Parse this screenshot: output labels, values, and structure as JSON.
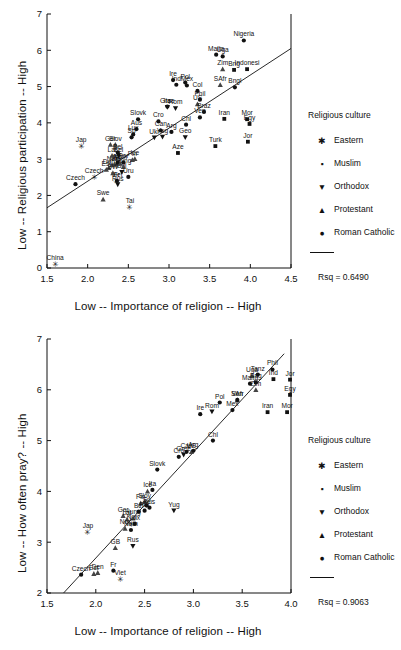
{
  "legend": {
    "title": "Religious culture",
    "entries": [
      {
        "label": "Eastern",
        "marker": "star-marker"
      },
      {
        "label": "Muslim",
        "marker": "square-marker"
      },
      {
        "label": "Orthodox",
        "marker": "triangle-down-marker"
      },
      {
        "label": "Protestant",
        "marker": "triangle-up-marker"
      },
      {
        "label": "Roman Catholic",
        "marker": "circle-marker"
      }
    ]
  },
  "charts": [
    {
      "id": "religious-participation",
      "chart_data": {
        "type": "scatter",
        "title": "",
        "xlabel": "Low -- Importance of religion -- High",
        "ylabel": "Low -- Religious participation -- High",
        "xlim": [
          1.5,
          4.5
        ],
        "ylim": [
          0,
          7
        ],
        "xticks": [
          "1.5",
          "2.0",
          "2.5",
          "3.0",
          "3.5",
          "4.0",
          "4.5"
        ],
        "yticks": [
          "0",
          "1",
          "2",
          "3",
          "4",
          "5",
          "6",
          "7"
        ],
        "grid": false,
        "legend_position": "right",
        "rsq_label": "Rsq = 0.6490",
        "rsq": 0.649,
        "fit_line": {
          "x": [
            1.5,
            4.5
          ],
          "y": [
            1.66,
            6.05
          ]
        },
        "series": [
          {
            "name": "Eastern",
            "marker": "star-marker",
            "points": [
              {
                "label": "China",
                "x": 1.6,
                "y": 0.1
              },
              {
                "label": "Jap",
                "x": 1.92,
                "y": 3.36
              },
              {
                "label": "Czech",
                "x": 2.08,
                "y": 2.52
              },
              {
                "label": "Tai",
                "x": 2.52,
                "y": 1.68
              },
              {
                "label": "Viet",
                "x": 2.36,
                "y": 2.4
              },
              {
                "label": "Kor",
                "x": 2.36,
                "y": 2.84
              }
            ]
          },
          {
            "name": "Muslim",
            "marker": "square-marker",
            "points": [
              {
                "label": "Turk",
                "x": 3.57,
                "y": 3.36
              },
              {
                "label": "Iran",
                "x": 3.68,
                "y": 4.11
              },
              {
                "label": "Mor",
                "x": 3.96,
                "y": 4.1
              },
              {
                "label": "Egy",
                "x": 3.99,
                "y": 3.97
              },
              {
                "label": "Jor",
                "x": 3.97,
                "y": 3.48
              },
              {
                "label": "Indonesi",
                "x": 3.96,
                "y": 5.48
              },
              {
                "label": "Bng",
                "x": 3.8,
                "y": 5.46
              },
              {
                "label": "Aze",
                "x": 3.11,
                "y": 3.17
              },
              {
                "label": "Alb",
                "x": 2.37,
                "y": 2.9
              }
            ]
          },
          {
            "name": "Orthodox",
            "marker": "triangle-down-marker",
            "points": [
              {
                "label": "Rus",
                "x": 2.37,
                "y": 2.3
              },
              {
                "label": "Gree",
                "x": 2.98,
                "y": 4.43
              },
              {
                "label": "Rom",
                "x": 3.08,
                "y": 4.4
              },
              {
                "label": "Bel",
                "x": 2.38,
                "y": 3.1
              },
              {
                "label": "Ukr",
                "x": 2.82,
                "y": 3.59
              },
              {
                "label": "Bul",
                "x": 2.42,
                "y": 2.64
              },
              {
                "label": "Yug",
                "x": 2.92,
                "y": 3.61
              },
              {
                "label": "Geo",
                "x": 3.2,
                "y": 3.6
              }
            ]
          },
          {
            "name": "Protestant",
            "marker": "triangle-up-marker",
            "points": [
              {
                "label": "SAfr",
                "x": 3.63,
                "y": 5.05
              },
              {
                "label": "Zim",
                "x": 3.66,
                "y": 5.48
              },
              {
                "label": "Est",
                "x": 2.23,
                "y": 2.71
              },
              {
                "label": "Den",
                "x": 2.26,
                "y": 2.76
              },
              {
                "label": "Swe",
                "x": 2.19,
                "y": 1.89
              },
              {
                "label": "Nor",
                "x": 2.3,
                "y": 2.84
              },
              {
                "label": "Fin",
                "x": 2.55,
                "y": 2.98
              },
              {
                "label": "GB",
                "x": 2.33,
                "y": 2.86
              },
              {
                "label": "Ger",
                "x": 2.28,
                "y": 3.4
              },
              {
                "label": "Lat",
                "x": 2.3,
                "y": 3.1
              },
              {
                "label": "Slov",
                "x": 2.34,
                "y": 3.4
              },
              {
                "label": "Ice",
                "x": 2.58,
                "y": 3.01
              },
              {
                "label": "Neth",
                "x": 2.4,
                "y": 2.88
              },
              {
                "label": "Hung",
                "x": 2.44,
                "y": 2.79
              },
              {
                "label": "US",
                "x": 3.35,
                "y": 4.52
              },
              {
                "label": "SW",
                "x": 2.31,
                "y": 2.62
              }
            ]
          },
          {
            "name": "Roman Catholic",
            "marker": "circle-marker",
            "points": [
              {
                "label": "Nigeria",
                "x": 3.92,
                "y": 6.27
              },
              {
                "label": "Malta",
                "x": 3.58,
                "y": 5.88
              },
              {
                "label": "Uga",
                "x": 3.66,
                "y": 5.83
              },
              {
                "label": "Ire",
                "x": 3.05,
                "y": 5.18
              },
              {
                "label": "Pol",
                "x": 3.2,
                "y": 5.11
              },
              {
                "label": "Ind",
                "x": 3.09,
                "y": 5.05
              },
              {
                "label": "Mex",
                "x": 3.22,
                "y": 5.03
              },
              {
                "label": "Col",
                "x": 3.35,
                "y": 4.88
              },
              {
                "label": "Bngl",
                "x": 3.81,
                "y": 4.98
              },
              {
                "label": "Phil",
                "x": 3.38,
                "y": 4.64
              },
              {
                "label": "Braz",
                "x": 3.43,
                "y": 4.3
              },
              {
                "label": "Ven",
                "x": 3.38,
                "y": 4.15
              },
              {
                "label": "Ita",
                "x": 2.98,
                "y": 4.45
              },
              {
                "label": "Slovk",
                "x": 2.62,
                "y": 4.1
              },
              {
                "label": "Cro",
                "x": 2.87,
                "y": 4.04
              },
              {
                "label": "Chl",
                "x": 3.21,
                "y": 3.95
              },
              {
                "label": "Can",
                "x": 2.9,
                "y": 3.79
              },
              {
                "label": "Arg",
                "x": 3.03,
                "y": 3.75
              },
              {
                "label": "Aus",
                "x": 2.6,
                "y": 3.83
              },
              {
                "label": "Sp",
                "x": 2.54,
                "y": 3.6
              },
              {
                "label": "Lux",
                "x": 2.56,
                "y": 3.68
              },
              {
                "label": "Bel",
                "x": 2.37,
                "y": 3.18
              },
              {
                "label": "Fr",
                "x": 2.36,
                "y": 2.4
              },
              {
                "label": "Uru",
                "x": 2.5,
                "y": 2.51
              },
              {
                "label": "Por",
                "x": 2.44,
                "y": 2.91
              },
              {
                "label": "Czech",
                "x": 1.85,
                "y": 2.31
              }
            ]
          }
        ]
      }
    },
    {
      "id": "how-often-pray",
      "chart_data": {
        "type": "scatter",
        "title": "",
        "xlabel": "Low -- Importance of religion -- High",
        "ylabel": "Low -- How often pray? -- High",
        "xlim": [
          1.5,
          4.0
        ],
        "ylim": [
          2,
          7
        ],
        "xticks": [
          "1.5",
          "2.0",
          "2.5",
          "3.0",
          "3.5",
          "4.0"
        ],
        "yticks": [
          "2",
          "3",
          "4",
          "5",
          "6",
          "7"
        ],
        "grid": false,
        "legend_position": "right",
        "rsq_label": "Rsq = 0.9063",
        "rsq": 0.9063,
        "fit_line": {
          "x": [
            1.67,
            3.93
          ],
          "y": [
            2.0,
            6.71
          ]
        },
        "series": [
          {
            "name": "Eastern",
            "marker": "star-marker",
            "points": [
              {
                "label": "Jap",
                "x": 1.92,
                "y": 3.2
              },
              {
                "label": "Viet",
                "x": 2.25,
                "y": 2.28
              },
              {
                "label": "Kor",
                "x": 2.37,
                "y": 3.37
              }
            ]
          },
          {
            "name": "Muslim",
            "marker": "square-marker",
            "points": [
              {
                "label": "Iran",
                "x": 3.76,
                "y": 5.56
              },
              {
                "label": "Mor",
                "x": 3.96,
                "y": 5.56
              },
              {
                "label": "Egy",
                "x": 3.99,
                "y": 5.9
              },
              {
                "label": "Jor",
                "x": 3.99,
                "y": 6.2
              },
              {
                "label": "Ind",
                "x": 3.82,
                "y": 6.21
              },
              {
                "label": "Bng",
                "x": 3.64,
                "y": 6.15
              }
            ]
          },
          {
            "name": "Orthodox",
            "marker": "triangle-down-marker",
            "points": [
              {
                "label": "Rus",
                "x": 2.38,
                "y": 2.92
              },
              {
                "label": "Rom",
                "x": 3.19,
                "y": 5.57
              },
              {
                "label": "Yug",
                "x": 2.8,
                "y": 3.62
              },
              {
                "label": "Gree",
                "x": 2.9,
                "y": 4.72
              }
            ]
          },
          {
            "name": "Protestant",
            "marker": "triangle-up-marker",
            "points": [
              {
                "label": "Est",
                "x": 1.98,
                "y": 2.38
              },
              {
                "label": "Den",
                "x": 2.02,
                "y": 2.4
              },
              {
                "label": "Fin",
                "x": 2.46,
                "y": 3.77
              },
              {
                "label": "Ger",
                "x": 2.28,
                "y": 3.52
              },
              {
                "label": "Lat",
                "x": 2.32,
                "y": 3.45
              },
              {
                "label": "Hung",
                "x": 2.38,
                "y": 3.47
              },
              {
                "label": "GB",
                "x": 2.2,
                "y": 2.89
              },
              {
                "label": "Nor",
                "x": 2.3,
                "y": 3.27
              },
              {
                "label": "Ice",
                "x": 2.53,
                "y": 4.0
              },
              {
                "label": "Zim",
                "x": 3.64,
                "y": 6.0
              },
              {
                "label": "Uga",
                "x": 3.6,
                "y": 6.28
              },
              {
                "label": "SAfr",
                "x": 3.45,
                "y": 5.8
              },
              {
                "label": "US",
                "x": 2.98,
                "y": 4.78
              },
              {
                "label": "Slov",
                "x": 2.5,
                "y": 3.8
              }
            ]
          },
          {
            "name": "Roman Catholic",
            "marker": "circle-marker",
            "points": [
              {
                "label": "Phil",
                "x": 3.81,
                "y": 6.4
              },
              {
                "label": "Tanz",
                "x": 3.66,
                "y": 6.3
              },
              {
                "label": "Malta",
                "x": 3.58,
                "y": 6.12
              },
              {
                "label": "Ven",
                "x": 3.45,
                "y": 5.8
              },
              {
                "label": "Pol",
                "x": 3.27,
                "y": 5.75
              },
              {
                "label": "Mex",
                "x": 3.4,
                "y": 5.6
              },
              {
                "label": "Ire",
                "x": 3.07,
                "y": 5.52
              },
              {
                "label": "Chl",
                "x": 3.2,
                "y": 5.0
              },
              {
                "label": "Arg",
                "x": 3.0,
                "y": 4.8
              },
              {
                "label": "Can",
                "x": 2.93,
                "y": 4.78
              },
              {
                "label": "Cro",
                "x": 2.85,
                "y": 4.68
              },
              {
                "label": "Slovk",
                "x": 2.63,
                "y": 4.43
              },
              {
                "label": "Ita",
                "x": 2.58,
                "y": 4.03
              },
              {
                "label": "Sp",
                "x": 2.52,
                "y": 3.72
              },
              {
                "label": "Lux",
                "x": 2.4,
                "y": 3.36
              },
              {
                "label": "Bel",
                "x": 2.44,
                "y": 3.6
              },
              {
                "label": "Por",
                "x": 2.5,
                "y": 3.62
              },
              {
                "label": "Aus",
                "x": 2.55,
                "y": 3.68
              },
              {
                "label": "Neth",
                "x": 2.36,
                "y": 3.24
              },
              {
                "label": "Fr",
                "x": 2.18,
                "y": 2.44
              },
              {
                "label": "Czech",
                "x": 1.85,
                "y": 2.36
              }
            ]
          }
        ]
      }
    }
  ]
}
